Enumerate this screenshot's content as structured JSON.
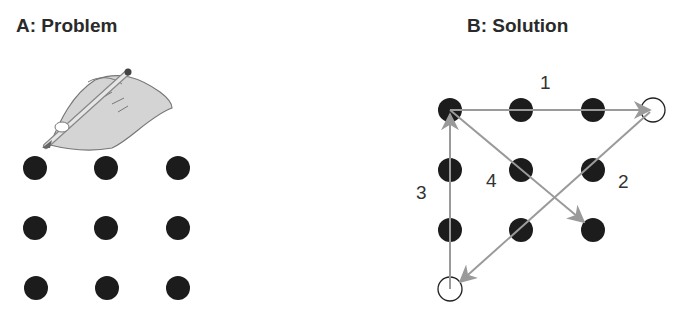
{
  "panel_a": {
    "title": "A: Problem",
    "icon": "hand-writing-pencil-icon",
    "grid": {
      "rows": 3,
      "cols": 3
    }
  },
  "panel_b": {
    "title": "B: Solution",
    "grid": {
      "rows": 3,
      "cols": 3
    },
    "extra_points": [
      "top-right-open-circle",
      "bottom-left-open-circle"
    ],
    "lines": [
      {
        "label": "1",
        "from": "top-left dot",
        "to": "top-right open circle"
      },
      {
        "label": "2",
        "from": "top-right open circle",
        "to": "bottom-left open circle"
      },
      {
        "label": "3",
        "from": "bottom-left open circle",
        "to": "top-left dot"
      },
      {
        "label": "4",
        "from": "top-left dot",
        "to": "bottom-right dot"
      }
    ]
  },
  "colors": {
    "dot": "#1c1c1c",
    "line": "#9a9a9a",
    "hand": "#d4d4d4"
  }
}
